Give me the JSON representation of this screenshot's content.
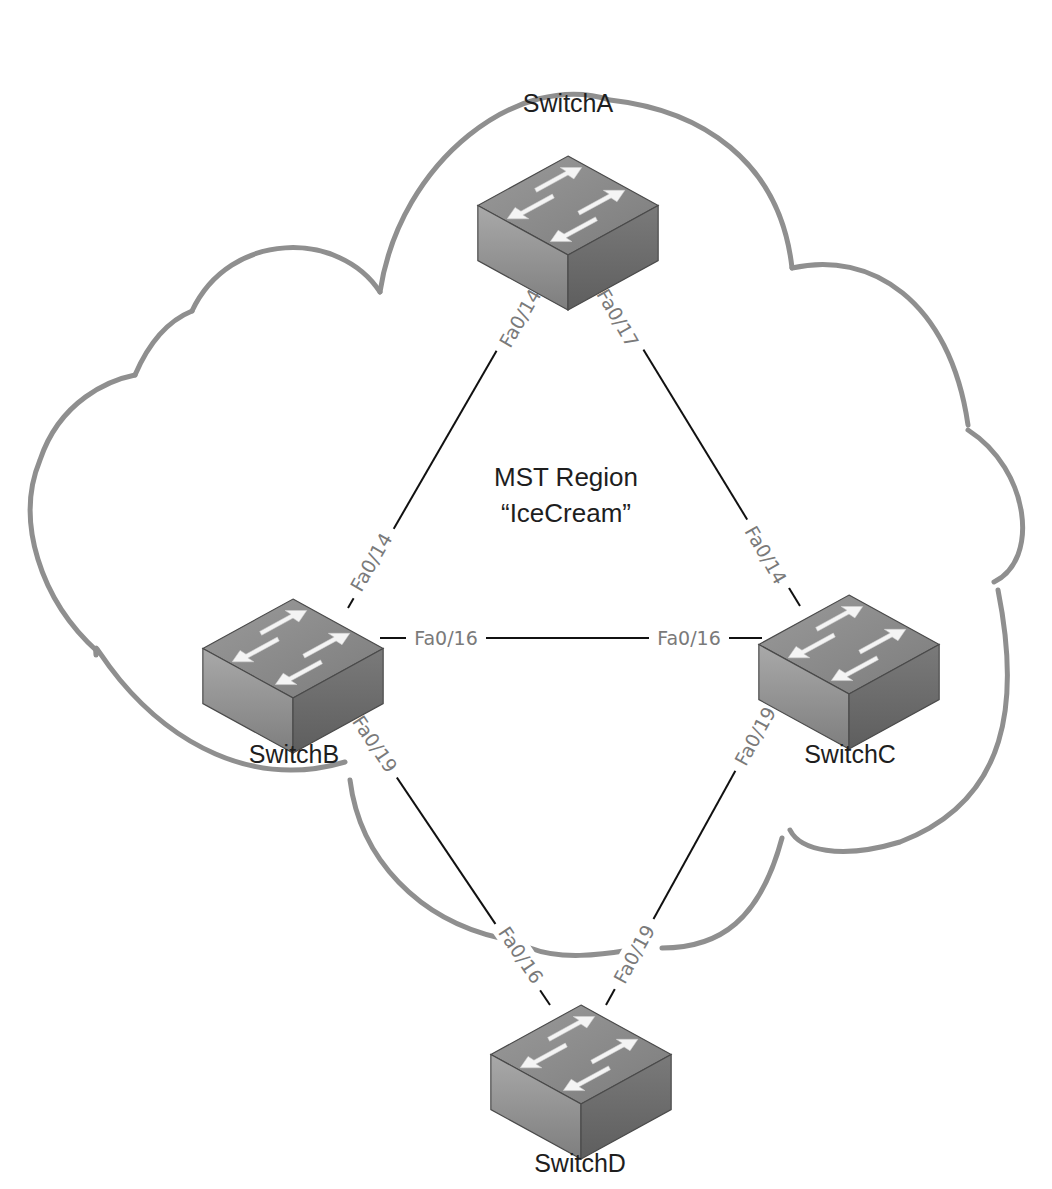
{
  "diagram": {
    "type": "network-topology",
    "region": {
      "line1": "MST Region",
      "line2": "“IceCream”"
    },
    "colors": {
      "cloud": "#8f8f8f",
      "link": "#111111",
      "port_label": "#7a7a7a",
      "text": "#1e1e1e",
      "switch_top": "#8c8c8c",
      "switch_left": "#9a9a9a",
      "switch_right": "#6e6e6e"
    },
    "switches": [
      {
        "id": "A",
        "label": "SwitchA"
      },
      {
        "id": "B",
        "label": "SwitchB"
      },
      {
        "id": "C",
        "label": "SwitchC"
      },
      {
        "id": "D",
        "label": "SwitchD"
      }
    ],
    "links": [
      {
        "from": "SwitchA",
        "from_port": "Fa0/14",
        "to": "SwitchB",
        "to_port": "Fa0/14"
      },
      {
        "from": "SwitchA",
        "from_port": "Fa0/17",
        "to": "SwitchC",
        "to_port": "Fa0/14"
      },
      {
        "from": "SwitchB",
        "from_port": "Fa0/16",
        "to": "SwitchC",
        "to_port": "Fa0/16"
      },
      {
        "from": "SwitchB",
        "from_port": "Fa0/19",
        "to": "SwitchD",
        "to_port": "Fa0/16"
      },
      {
        "from": "SwitchC",
        "from_port": "Fa0/19",
        "to": "SwitchD",
        "to_port": "Fa0/19"
      }
    ]
  }
}
